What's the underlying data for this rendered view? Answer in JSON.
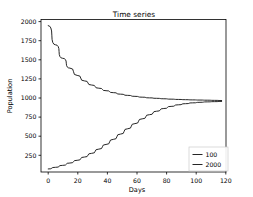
{
  "chart_data": {
    "type": "line",
    "title": "Time series",
    "xlabel": "Days",
    "ylabel": "Population",
    "xlim": [
      -5,
      123
    ],
    "ylim": [
      60,
      2080
    ],
    "xticks": [
      0,
      20,
      40,
      60,
      80,
      100,
      120
    ],
    "xticklabels": [
      "0",
      "20",
      "40",
      "60",
      "80",
      "100",
      "120"
    ],
    "yticks": [
      250,
      500,
      750,
      1000,
      1250,
      1500,
      1750,
      2000
    ],
    "yticklabels": [
      "250",
      "500",
      "750",
      "1000",
      "1250",
      "1500",
      "1750",
      "2000"
    ],
    "grid": false,
    "legend_position": "lower right",
    "carrying_capacity": 1000,
    "x": [
      0,
      5,
      10,
      15,
      20,
      25,
      30,
      35,
      40,
      45,
      50,
      55,
      60,
      65,
      70,
      75,
      80,
      85,
      90,
      95,
      100,
      105,
      110,
      115,
      120
    ],
    "series": [
      {
        "name": "100",
        "color": "#1a1a1a",
        "initial_value": 100,
        "values": [
          100,
          122,
          148,
          179,
          215,
          258,
          307,
          363,
          425,
          492,
          562,
          633,
          701,
          764,
          819,
          865,
          901,
          929,
          950,
          965,
          976,
          983,
          989,
          992,
          995
        ]
      },
      {
        "name": "2000",
        "color": "#1a1a1a",
        "initial_value": 2000,
        "values": [
          2000,
          1745,
          1566,
          1436,
          1340,
          1267,
          1212,
          1170,
          1137,
          1111,
          1091,
          1075,
          1062,
          1051,
          1042,
          1036,
          1030,
          1025,
          1021,
          1018,
          1015,
          1013,
          1011,
          1009,
          1007
        ]
      }
    ],
    "legend_entries": [
      "100",
      "2000"
    ]
  }
}
